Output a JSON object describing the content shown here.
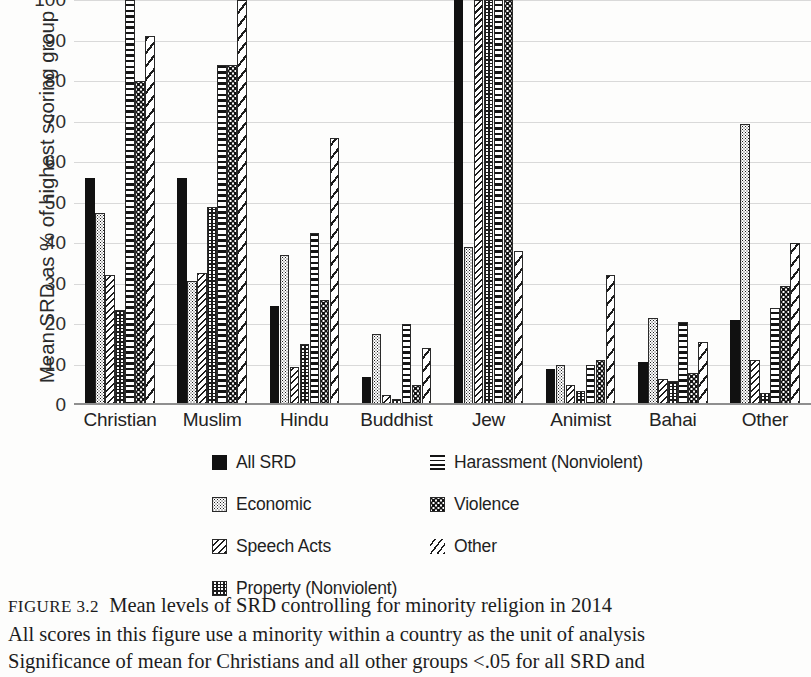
{
  "chart_data": {
    "type": "bar",
    "title": "",
    "xlabel": "",
    "ylabel": "Mean SRD as % of highest scoring group",
    "ylim": [
      0,
      100
    ],
    "yticks": [
      100,
      90,
      80,
      70,
      60,
      50,
      40,
      30,
      20,
      10,
      0
    ],
    "ytick_labels": [
      "100",
      "90",
      "80",
      "70",
      "60",
      "50",
      "40",
      "30",
      "20",
      "10",
      "0"
    ],
    "grid": true,
    "legend_position": "below-plot",
    "categories": [
      "Christian",
      "Muslim",
      "Hindu",
      "Buddhist",
      "Jew",
      "Animist",
      "Bahai",
      "Other"
    ],
    "series": [
      {
        "name": "All SRD",
        "pattern": "solid-black",
        "values": [
          56,
          56,
          24.5,
          7,
          100,
          8.8,
          10.5,
          21
        ]
      },
      {
        "name": "Economic",
        "pattern": "fine-dots",
        "values": [
          47.5,
          30.5,
          37,
          17.5,
          39,
          9.8,
          21.5,
          69.5
        ]
      },
      {
        "name": "Speech Acts",
        "pattern": "diagonal-hatch",
        "values": [
          32,
          32.5,
          9.5,
          2.5,
          100,
          5,
          6.5,
          11
        ]
      },
      {
        "name": "Property (Nonviolent)",
        "pattern": "crosshatch-grid",
        "values": [
          23.5,
          49,
          15,
          1.5,
          100,
          3.5,
          6,
          3
        ]
      },
      {
        "name": "Harassment (Nonviolent)",
        "pattern": "horizontal-lines",
        "values": [
          100,
          84,
          42.5,
          20,
          100,
          10,
          20.5,
          24
        ]
      },
      {
        "name": "Violence",
        "pattern": "coarse-dots",
        "values": [
          80,
          84,
          26,
          5,
          100,
          11,
          8,
          29.5
        ]
      },
      {
        "name": "Other",
        "pattern": "sparse-diagonals",
        "values": [
          91,
          100,
          66,
          14,
          38,
          32,
          15.5,
          40
        ]
      }
    ]
  },
  "legend": {
    "items": [
      {
        "label": "All SRD",
        "swatch": "solid-black-swatch"
      },
      {
        "label": "Harassment (Nonviolent)",
        "swatch": "horizontal-lines-swatch"
      },
      {
        "label": "Economic",
        "swatch": "fine-dots-swatch"
      },
      {
        "label": "Violence",
        "swatch": "coarse-dots-swatch"
      },
      {
        "label": "Speech Acts",
        "swatch": "diagonal-hatch-swatch"
      },
      {
        "label": "Other",
        "swatch": "sparse-diagonals-swatch"
      },
      {
        "label": "Property (Nonviolent)",
        "swatch": "crosshatch-grid-swatch"
      }
    ]
  },
  "caption": {
    "figure_number": "FIGURE 3.2",
    "title": "Mean levels of SRD controlling for minority religion in 2014",
    "line2": "All scores in this figure use a minority within a country as the unit of analysis",
    "line3": "Significance of mean for Christians and all other groups <.05 for all SRD and"
  },
  "colors": {
    "ink": "#111111",
    "gridline": "#d9d9d9",
    "axis": "#8f8f8f",
    "background": "#fdfdfc"
  }
}
